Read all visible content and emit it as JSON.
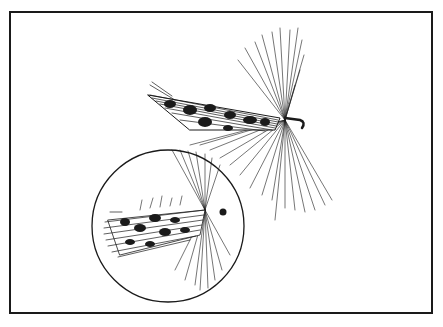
{
  "illustration": {
    "subject": "two fishing flies",
    "colors": {
      "ink": "#1a1a1a",
      "paper": "#ffffff"
    }
  }
}
